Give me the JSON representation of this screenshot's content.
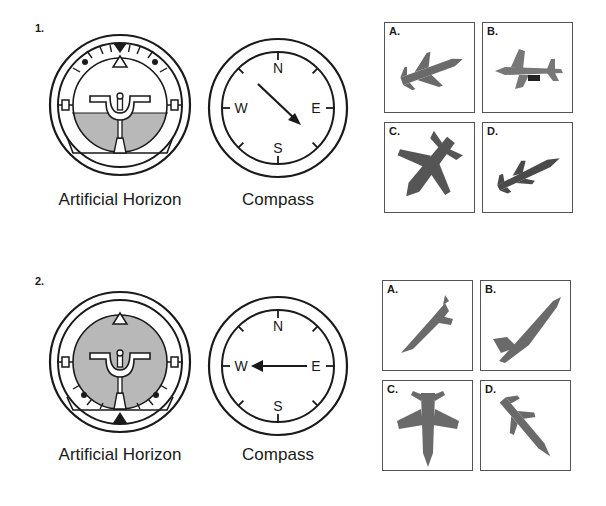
{
  "questions": [
    {
      "number": "1.",
      "instruments": {
        "artificial_horizon": {
          "caption": "Artificial Horizon",
          "attitude": "level pitch, nose slightly up; sky above, ground (gray) below; bank pointer at top"
        },
        "compass": {
          "caption": "Compass",
          "labels": [
            "N",
            "E",
            "S",
            "W"
          ],
          "heading": "southeast"
        }
      },
      "options": [
        {
          "label": "A.",
          "description": "jet climbing toward upper right"
        },
        {
          "label": "B.",
          "description": "jet viewed from below heading right"
        },
        {
          "label": "C.",
          "description": "jet diving toward lower right"
        },
        {
          "label": "D.",
          "description": "jet banking climbing to upper right"
        }
      ]
    },
    {
      "number": "2.",
      "instruments": {
        "artificial_horizon": {
          "caption": "Artificial Horizon",
          "attitude": "inverted / all ground; bank pointer at bottom"
        },
        "compass": {
          "caption": "Compass",
          "labels": [
            "N",
            "E",
            "S",
            "W"
          ],
          "heading": "west"
        }
      },
      "options": [
        {
          "label": "A.",
          "description": "jet nose-down diving toward lower left"
        },
        {
          "label": "B.",
          "description": "jet climbing steeply to upper right"
        },
        {
          "label": "C.",
          "description": "jet viewed from above, nose down"
        },
        {
          "label": "D.",
          "description": "jet diving toward lower right"
        }
      ]
    }
  ],
  "colors": {
    "ground": "#b8b8b8",
    "ink": "#1a1a1a",
    "jet": "#6a6a6a",
    "frame": "#555555"
  }
}
